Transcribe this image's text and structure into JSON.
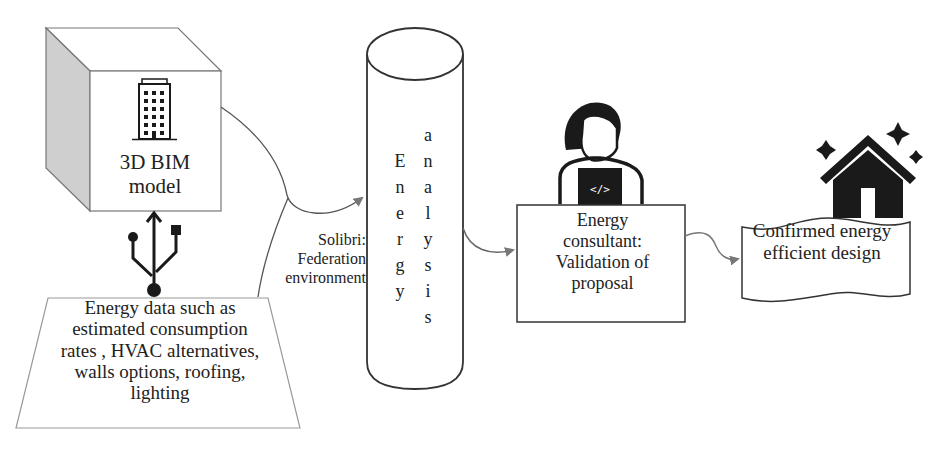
{
  "diagram": {
    "type": "flow",
    "nodes": {
      "bim_model": {
        "label_line1": "3D BIM",
        "label_line2": "model",
        "icon": "building-icon",
        "shape": "3d-cube"
      },
      "energy_data": {
        "lines": [
          "Energy data such as",
          "estimated consumption",
          "rates , HVAC alternatives,",
          "walls options, roofing,",
          "lighting"
        ],
        "shape": "trapezoid",
        "connector_icon": "usb-icon"
      },
      "federation": {
        "lines": [
          "Solibri:",
          "Federation",
          "environment"
        ]
      },
      "energy_analysis": {
        "word1": [
          "E",
          "n",
          "e",
          "r",
          "g",
          "y"
        ],
        "word2": [
          "a",
          "n",
          "a",
          "l",
          "y",
          "s",
          "i",
          "s"
        ],
        "shape": "cylinder"
      },
      "consultant": {
        "lines": [
          "Energy",
          "consultant:",
          "Validation of",
          "proposal"
        ],
        "icon": "developer-at-laptop-icon",
        "laptop_glyph": "</>"
      },
      "confirmed": {
        "lines": [
          "Confirmed energy",
          "efficient design"
        ],
        "icon": "sparkling-house-icon",
        "shape": "banner"
      }
    },
    "edges": [
      {
        "from": "bim_model",
        "to": "energy_analysis"
      },
      {
        "from": "energy_data",
        "to": "energy_analysis",
        "label": "Solibri: Federation environment"
      },
      {
        "from": "energy_analysis",
        "to": "consultant"
      },
      {
        "from": "consultant",
        "to": "confirmed"
      }
    ],
    "colors": {
      "stroke": "#333333",
      "arrow": "#777777",
      "cube_side": "#c8c8c8",
      "icon": "#1a1a1a",
      "trapezoid_stroke": "#999999"
    }
  }
}
